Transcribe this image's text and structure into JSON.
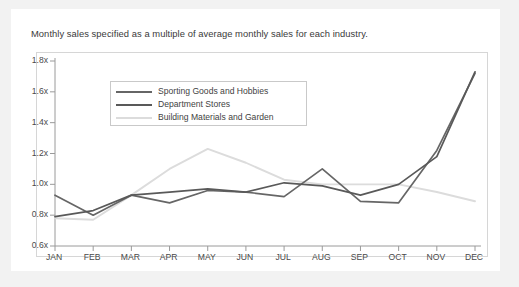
{
  "card": {
    "title": "Monthly sales specified as a multiple of average monthly sales for each industry."
  },
  "legend": {
    "position": "top-left-inside",
    "items": [
      {
        "label": "Sporting Goods and Hobbies",
        "color": "#666666"
      },
      {
        "label": "Department Stores",
        "color": "#595959"
      },
      {
        "label": "Building Materials and Garden",
        "color": "#dcdcdc"
      }
    ]
  },
  "axes": {
    "y_ticks": [
      "0.6x",
      "0.8x",
      "1.0x",
      "1.2x",
      "1.4x",
      "1.6x",
      "1.8x"
    ],
    "x_ticks": [
      "JAN",
      "FEB",
      "MAR",
      "APR",
      "MAY",
      "JUN",
      "JUL",
      "AUG",
      "SEP",
      "OCT",
      "NOV",
      "DEC"
    ]
  },
  "chart_data": {
    "type": "line",
    "title": "Monthly sales specified as a multiple of average monthly sales for each industry.",
    "xlabel": "",
    "ylabel": "",
    "categories": [
      "JAN",
      "FEB",
      "MAR",
      "APR",
      "MAY",
      "JUN",
      "JUL",
      "AUG",
      "SEP",
      "OCT",
      "NOV",
      "DEC"
    ],
    "ylim": [
      0.6,
      1.8
    ],
    "ytick_values": [
      0.6,
      0.8,
      1.0,
      1.2,
      1.4,
      1.6,
      1.8
    ],
    "ytick_labels": [
      "0.6x",
      "0.8x",
      "1.0x",
      "1.2x",
      "1.4x",
      "1.6x",
      "1.8x"
    ],
    "grid": false,
    "legend_position": "upper left",
    "series": [
      {
        "name": "Sporting Goods and Hobbies",
        "color": "#666666",
        "values": [
          0.93,
          0.8,
          0.93,
          0.88,
          0.96,
          0.95,
          0.92,
          1.1,
          0.89,
          0.88,
          1.22,
          1.72
        ]
      },
      {
        "name": "Department Stores",
        "color": "#595959",
        "values": [
          0.79,
          0.83,
          0.93,
          0.95,
          0.97,
          0.95,
          1.01,
          0.99,
          0.93,
          1.0,
          1.18,
          1.73
        ]
      },
      {
        "name": "Building Materials and Garden",
        "color": "#dcdcdc",
        "values": [
          0.78,
          0.77,
          0.93,
          1.1,
          1.23,
          1.14,
          1.03,
          1.0,
          1.0,
          1.0,
          0.95,
          0.89
        ]
      }
    ]
  }
}
